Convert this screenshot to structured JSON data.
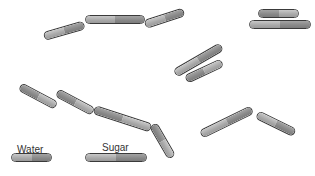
{
  "labels": {
    "water": "Water",
    "sugar": "Sugar"
  },
  "capsules": [
    {
      "x": 44,
      "y": 36,
      "w": 42,
      "r": -16,
      "type": "water",
      "order": "ab"
    },
    {
      "x": 85,
      "y": 19,
      "w": 60,
      "r": 0,
      "type": "sugar",
      "order": "ab"
    },
    {
      "x": 145,
      "y": 24,
      "w": 41,
      "r": -18,
      "type": "water",
      "order": "ab"
    },
    {
      "x": 258,
      "y": 13,
      "w": 41,
      "r": 0,
      "type": "water",
      "order": "ba"
    },
    {
      "x": 249,
      "y": 24,
      "w": 62,
      "r": 0,
      "type": "sugar",
      "order": "ab"
    },
    {
      "x": 175,
      "y": 73,
      "w": 54,
      "r": -30,
      "type": "sugar",
      "order": "ab"
    },
    {
      "x": 186,
      "y": 79,
      "w": 40,
      "r": -25,
      "type": "water",
      "order": "ba"
    },
    {
      "x": 20,
      "y": 86,
      "w": 41,
      "r": 28,
      "type": "water",
      "order": "ba"
    },
    {
      "x": 57,
      "y": 92,
      "w": 41,
      "r": 28,
      "type": "water",
      "order": "ba"
    },
    {
      "x": 94,
      "y": 109,
      "w": 60,
      "r": 18,
      "type": "sugar",
      "order": "ba"
    },
    {
      "x": 153,
      "y": 124,
      "w": 38,
      "r": 60,
      "type": "water",
      "order": "ba"
    },
    {
      "x": 201,
      "y": 134,
      "w": 57,
      "r": -26,
      "type": "sugar",
      "order": "ab"
    },
    {
      "x": 257,
      "y": 114,
      "w": 42,
      "r": 26,
      "type": "water",
      "order": "ab"
    },
    {
      "x": 11,
      "y": 157,
      "w": 41,
      "r": 0,
      "type": "water",
      "order": "ab"
    },
    {
      "x": 85,
      "y": 157,
      "w": 62,
      "r": 0,
      "type": "sugar",
      "order": "ab"
    }
  ]
}
